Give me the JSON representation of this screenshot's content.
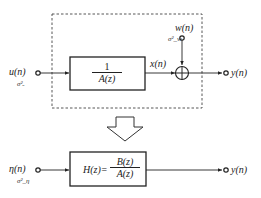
{
  "top_diagram": {
    "input_label": "u(n)",
    "input_variance": "σ²ᵤ",
    "block": {
      "numerator": "1",
      "denominator": "A(z)"
    },
    "intermediate_label": "x(n)",
    "noise_label": "w(n)",
    "noise_variance": "σ²_w",
    "adder_symbol": "⊕",
    "output_label": "y(n)"
  },
  "arrow": "down-hollow-arrow",
  "bottom_diagram": {
    "input_label": "η(n)",
    "input_variance": "σ²_η",
    "block": {
      "prefix": "H(z)=",
      "numerator": "B(z)",
      "denominator": "A(z)"
    },
    "output_label": "y(n)"
  }
}
